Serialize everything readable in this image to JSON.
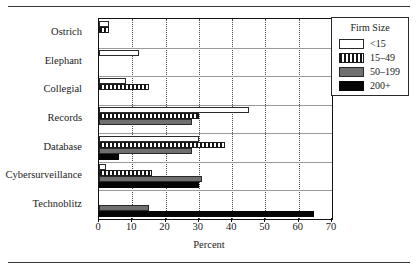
{
  "chart_data": {
    "type": "bar",
    "orientation": "horizontal",
    "title": "",
    "xlabel": "Percent",
    "ylabel": "",
    "xlim": [
      0,
      70
    ],
    "xticks": [
      0,
      10,
      20,
      30,
      40,
      50,
      60,
      70
    ],
    "grid": "vertical-dotted",
    "categories": [
      "Ostrich",
      "Elephant",
      "Collegial",
      "Records",
      "Database",
      "Cybersurveillance",
      "Technoblitz"
    ],
    "legend": {
      "title": "Firm Size",
      "position": "right-outside",
      "entries": [
        {
          "label": "<15",
          "fill": "white",
          "color": "#ffffff"
        },
        {
          "label": "15–49",
          "fill": "striped",
          "color": "#141414"
        },
        {
          "label": "50–199",
          "fill": "gray",
          "color": "#6f6f6f"
        },
        {
          "label": "200+",
          "fill": "black",
          "color": "#050505"
        }
      ]
    },
    "series": [
      {
        "name": "<15",
        "fill": "white",
        "values": [
          3.0,
          12.0,
          8.0,
          45.0,
          30.0,
          2.0,
          0.0
        ]
      },
      {
        "name": "15–49",
        "fill": "striped",
        "values": [
          3.0,
          0.0,
          15.0,
          30.0,
          38.0,
          16.0,
          0.0
        ]
      },
      {
        "name": "50–199",
        "fill": "gray",
        "values": [
          0.0,
          0.0,
          0.0,
          28.0,
          28.0,
          31.0,
          15.0
        ]
      },
      {
        "name": "200+",
        "fill": "black",
        "values": [
          0.0,
          0.0,
          0.0,
          0.0,
          6.0,
          30.0,
          64.5
        ]
      }
    ]
  }
}
